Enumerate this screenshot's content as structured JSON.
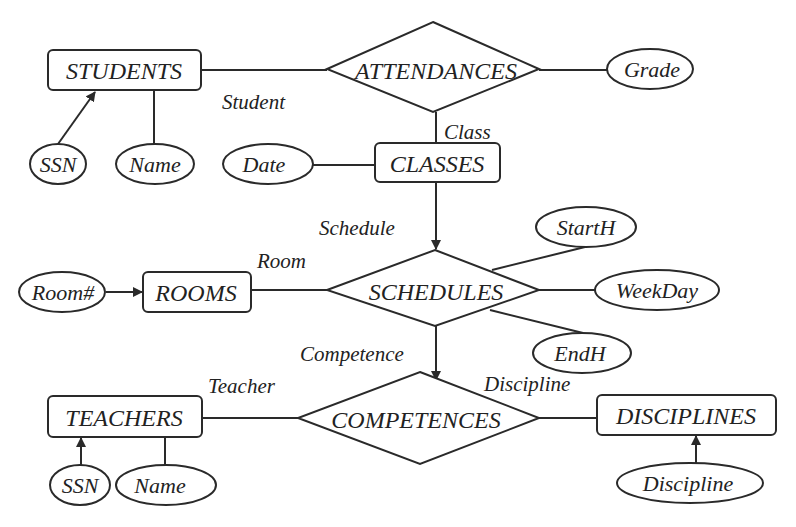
{
  "diagram": {
    "type": "entity-relationship",
    "entities": {
      "students": "STUDENTS",
      "classes": "CLASSES",
      "rooms": "ROOMS",
      "teachers": "TEACHERS",
      "disciplines": "DISCIPLINES"
    },
    "relationships": {
      "attendances": "ATTENDANCES",
      "schedules": "SCHEDULES",
      "competences": "COMPETENCES"
    },
    "attributes": {
      "students_ssn": "SSN",
      "students_name": "Name",
      "attendances_grade": "Grade",
      "classes_date": "Date",
      "rooms_roomno": "Room#",
      "schedules_starth": "StartH",
      "schedules_weekday": "WeekDay",
      "schedules_endh": "EndH",
      "teachers_ssn": "SSN",
      "teachers_name": "Name",
      "disciplines_discipline": "Discipline"
    },
    "roles": {
      "student": "Student",
      "class": "Class",
      "schedule": "Schedule",
      "room": "Room",
      "competence": "Competence",
      "teacher": "Teacher",
      "discipline": "Discipline"
    },
    "colors": {
      "stroke": "#2a2a2a",
      "text": "#222222",
      "background": "#ffffff"
    }
  }
}
